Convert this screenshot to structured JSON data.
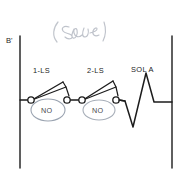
{
  "diagram": {
    "title_annotation": "( serie",
    "annotation_color": "#b9bcc4",
    "line_color": "#1c1c1c",
    "highlight_color": "#9aa3b0",
    "background": "#ffffff",
    "rails": {
      "left_label": "B'",
      "left_x": 20,
      "right_x": 172,
      "top_y": 36,
      "bottom_y": 168
    },
    "rung_y": 100,
    "components": [
      {
        "id": "switch-1",
        "label": "1-LS",
        "type": "limit-switch-normally-open",
        "state_label": "NO",
        "label_x": 46,
        "label_y": 70,
        "pivot_x": 31,
        "contact_x": 67,
        "badge_cx": 48,
        "badge_cy": 110,
        "badge_rx": 17,
        "badge_ry": 11
      },
      {
        "id": "switch-2",
        "label": "2-LS",
        "type": "limit-switch-normally-open",
        "state_label": "NO",
        "label_x": 100,
        "label_y": 70,
        "pivot_x": 82,
        "contact_x": 116,
        "badge_cx": 99,
        "badge_cy": 110,
        "badge_rx": 16,
        "badge_ry": 10
      },
      {
        "id": "solenoid-a",
        "label": "SOL A",
        "type": "solenoid-coil",
        "label_x": 146,
        "label_y": 69,
        "start_x": 116,
        "end_x": 172
      }
    ]
  }
}
